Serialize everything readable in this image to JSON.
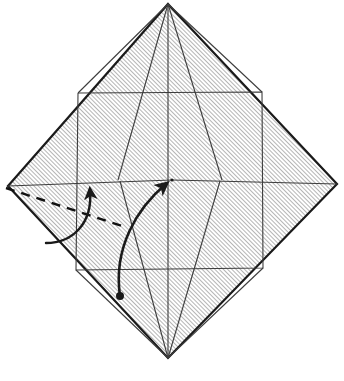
{
  "figure": {
    "type": "origami-diagram",
    "canvas": {
      "width": 344,
      "height": 381
    },
    "background_color": "#ffffff",
    "paper": {
      "fill_pattern": "diagonal-hatch",
      "hatch_color": "#8a8a8a",
      "hatch_background": "#ffffff",
      "hatch_spacing_px": 3,
      "hatch_angle_deg": 45,
      "outline_color": "#1a1a1a",
      "outline_width_px": 2.2,
      "shape": "diamond",
      "vertices": {
        "top": {
          "x": 168,
          "y": 4
        },
        "right": {
          "x": 337,
          "y": 184
        },
        "bottom": {
          "x": 168,
          "y": 358
        },
        "left": {
          "x": 8,
          "y": 186
        }
      }
    },
    "center_point": {
      "x": 172,
      "y": 180
    },
    "inner_square": {
      "description": "rotated inner square joining edge midpoints",
      "stroke_color": "#3c3c3c",
      "stroke_width_px": 1.1,
      "corners": {
        "top_left": {
          "x": 78,
          "y": 93
        },
        "top_right": {
          "x": 262,
          "y": 92
        },
        "bottom_right": {
          "x": 263,
          "y": 268
        },
        "bottom_left": {
          "x": 76,
          "y": 270
        }
      }
    },
    "crease_lines": [
      {
        "name": "vertical-center-crease",
        "from": {
          "x": 168,
          "y": 4
        },
        "to": {
          "x": 168,
          "y": 358
        },
        "style": "solid-thin"
      },
      {
        "name": "crease-top-to-inner-left",
        "from": {
          "x": 168,
          "y": 4
        },
        "to": {
          "x": 78,
          "y": 93
        },
        "style": "solid-thin"
      },
      {
        "name": "crease-top-to-inner-right",
        "from": {
          "x": 168,
          "y": 4
        },
        "to": {
          "x": 262,
          "y": 92
        },
        "style": "solid-thin"
      },
      {
        "name": "crease-top-to-center-left",
        "from": {
          "x": 168,
          "y": 4
        },
        "to": {
          "x": 118,
          "y": 180
        },
        "style": "solid-thin"
      },
      {
        "name": "crease-top-to-center-right",
        "from": {
          "x": 168,
          "y": 4
        },
        "to": {
          "x": 222,
          "y": 180
        },
        "style": "solid-thin"
      },
      {
        "name": "crease-bottom-to-inner-left",
        "from": {
          "x": 168,
          "y": 358
        },
        "to": {
          "x": 76,
          "y": 270
        },
        "style": "solid-thin"
      },
      {
        "name": "crease-bottom-to-inner-right",
        "from": {
          "x": 168,
          "y": 358
        },
        "to": {
          "x": 263,
          "y": 268
        },
        "style": "solid-thin"
      },
      {
        "name": "crease-bottom-to-center-left",
        "from": {
          "x": 168,
          "y": 358
        },
        "to": {
          "x": 120,
          "y": 181
        },
        "style": "solid-thin"
      },
      {
        "name": "crease-bottom-to-center-right",
        "from": {
          "x": 168,
          "y": 358
        },
        "to": {
          "x": 220,
          "y": 181
        },
        "style": "solid-thin"
      },
      {
        "name": "crease-horizontal-left",
        "from": {
          "x": 8,
          "y": 186
        },
        "to": {
          "x": 172,
          "y": 180
        },
        "style": "solid-thin"
      },
      {
        "name": "crease-horizontal-right",
        "from": {
          "x": 172,
          "y": 180
        },
        "to": {
          "x": 337,
          "y": 184
        },
        "style": "solid-thin"
      }
    ],
    "fold_marks": [
      {
        "name": "valley-fold-dashed-line",
        "style": "dashed",
        "stroke_color": "#111111",
        "stroke_width_px": 2.4,
        "dash_pattern": "9 7",
        "from": {
          "x": 6,
          "y": 188
        },
        "to": {
          "x": 122,
          "y": 226
        }
      }
    ],
    "arrows": [
      {
        "name": "fold-arrow-upper-left",
        "style": "curved-solid",
        "stroke_color": "#1a1a1a",
        "stroke_width_px": 2.4,
        "start": {
          "x": 46,
          "y": 243
        },
        "end": {
          "x": 92,
          "y": 184
        },
        "control_1": {
          "x": 72,
          "y": 243
        },
        "control_2": {
          "x": 93,
          "y": 224
        },
        "head": "filled-triangle",
        "has_start_dot": false
      },
      {
        "name": "fold-arrow-to-center",
        "style": "curved-solid",
        "stroke_color": "#1a1a1a",
        "stroke_width_px": 2.6,
        "start": {
          "x": 120,
          "y": 296
        },
        "end": {
          "x": 170,
          "y": 181
        },
        "control_1": {
          "x": 115,
          "y": 250
        },
        "control_2": {
          "x": 136,
          "y": 210
        },
        "head": "filled-triangle",
        "has_start_dot": true,
        "start_dot_radius_px": 4
      }
    ],
    "labels": []
  }
}
